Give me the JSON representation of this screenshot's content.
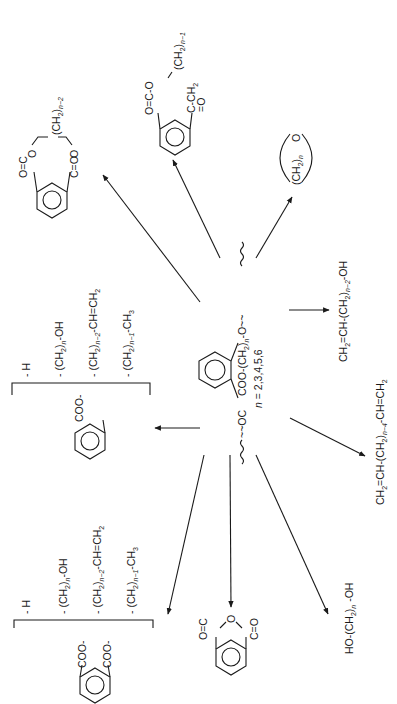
{
  "figure": {
    "orientation": "rotated -90deg",
    "center": {
      "name": "polymer-repeat-unit",
      "left_group": "~~OC",
      "right_group": "COO-(CH2)n-O~~",
      "n_values": "n = 2,3,4,5,6"
    },
    "products": [
      {
        "id": "cyclic-diester",
        "label": "cyclic phthalate diester with (CH2)n-2 bridge",
        "bridge": "(CH2)n-2",
        "groups": [
          "O=C",
          "C=O",
          "O",
          "O"
        ]
      },
      {
        "id": "lactone-ester",
        "label": "cyclic keto-ester",
        "parts": [
          "O=C-O",
          "(CH2)n-1",
          "C-CH2",
          "=O"
        ]
      },
      {
        "id": "cyclic-ether",
        "label": "(CH2)n O cyclic ether",
        "ring": "(CH2)n",
        "hetero": "O"
      },
      {
        "id": "unsaturated-alcohol",
        "formula": "CH2=CH-(CH2)n-2-OH"
      },
      {
        "id": "diene",
        "formula": "CH2=CH-(CH2)n-4-CH=CH2"
      },
      {
        "id": "diol",
        "formula": "HO-(CH2)n-OH"
      },
      {
        "id": "phthalic-anhydride",
        "label": "phthalic anhydride",
        "groups": [
          "O=C",
          "O",
          "C=O"
        ]
      },
      {
        "id": "phthalate-esters",
        "core": "COO- / COO-",
        "substituents": [
          "-H",
          "-(CH2)n-OH",
          "-(CH2)n-2-CH=CH2",
          "-(CH2)n-1-CH3"
        ]
      },
      {
        "id": "benzoate-esters",
        "core": "COO-",
        "substituents": [
          "-H",
          "-(CH2)n-OH",
          "-(CH2)n-2-CH=CH2",
          "-(CH2)n-1-CH3"
        ]
      }
    ],
    "text": {
      "center_left": "~~OC",
      "center_right": "COO-(CH",
      "center_right_sub": "2",
      "center_right2": ")",
      "center_right_n": "n",
      "center_right3": "-O~~",
      "n_label": "n",
      "n_values": " = 2,3,4,5,6",
      "sub_H": "- H",
      "sub_OH_a": "- (CH",
      "sub_OH_b": "2",
      "sub_OH_c": ")",
      "sub_OH_d": "n",
      "sub_OH_e": "-OH",
      "sub_vinyl_a": "- (CH",
      "sub_vinyl_b": "2",
      "sub_vinyl_c": ")",
      "sub_vinyl_d": "n−2",
      "sub_vinyl_e": "-CH=CH",
      "sub_vinyl_f": "2",
      "sub_alkyl_a": "- (CH",
      "sub_alkyl_b": "2",
      "sub_alkyl_c": ")",
      "sub_alkyl_d": "n−1",
      "sub_alkyl_e": "-CH",
      "sub_alkyl_f": "3",
      "coo": "COO-",
      "o_eq_c": "O=C",
      "c_eq_o": "C=O",
      "o": "O",
      "ch2_bridge_a": "(CH",
      "ch2_bridge_b": "2",
      "ch2_bridge_c": ")",
      "ch2_bridge_d": "n−2",
      "lac_top": "O=C-O",
      "lac_ch2a": "(CH",
      "lac_ch2b": "2",
      "lac_ch2c": ")",
      "lac_ch2d": "n−1",
      "lac_bot": "C-CH",
      "lac_bot_sub": "2",
      "lac_co": "=O",
      "ether_a": "(CH",
      "ether_b": "2",
      "ether_c": ")",
      "ether_d": "n",
      "ether_o": "O",
      "alc_a": "CH",
      "alc_b": "2",
      "alc_c": "=CH-(CH",
      "alc_d": "2",
      "alc_e": ")",
      "alc_f": "n−2",
      "alc_g": "-OH",
      "diene_a": "CH",
      "diene_b": "2",
      "diene_c": "=CH-(CH",
      "diene_d": "2",
      "diene_e": ")",
      "diene_f": "n−4",
      "diene_g": "-CH=CH",
      "diene_h": "2",
      "diol_a": "HO-(CH",
      "diol_b": "2",
      "diol_c": ")",
      "diol_d": "n",
      "diol_e": " -OH"
    }
  }
}
